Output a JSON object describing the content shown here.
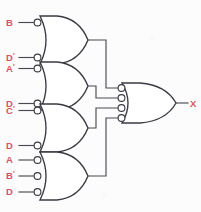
{
  "diagram": {
    "background_color": "#fcfcfc",
    "wire_color": "#4a4a52",
    "gate_outline_color": "#3a3a42",
    "label_color": "#d4545c",
    "output": {
      "label": "X",
      "name": "output-x"
    },
    "gates": [
      {
        "id": "gate-1",
        "type": "or-gate-inverted-inputs",
        "inputs": [
          {
            "label": "B",
            "prime": "",
            "inverted": true
          },
          {
            "label": "D",
            "prime": "′",
            "inverted": true
          }
        ]
      },
      {
        "id": "gate-2",
        "type": "or-gate-inverted-inputs",
        "inputs": [
          {
            "label": "A",
            "prime": "′",
            "inverted": true
          },
          {
            "label": "D",
            "prime": "",
            "inverted": true
          }
        ]
      },
      {
        "id": "gate-3",
        "type": "or-gate-inverted-inputs",
        "inputs": [
          {
            "label": "C",
            "prime": "′",
            "inverted": true
          },
          {
            "label": "D",
            "prime": "",
            "inverted": true
          }
        ]
      },
      {
        "id": "gate-4",
        "type": "or-gate-inverted-inputs",
        "inputs": [
          {
            "label": "A",
            "prime": "",
            "inverted": true
          },
          {
            "label": "B",
            "prime": "′",
            "inverted": true
          },
          {
            "label": "D",
            "prime": "",
            "inverted": true
          }
        ]
      },
      {
        "id": "gate-output",
        "type": "or-gate-inverted-inputs",
        "input_count": 4,
        "inputs": [
          {
            "label": "",
            "prime": "",
            "inverted": true
          },
          {
            "label": "",
            "prime": "",
            "inverted": true
          },
          {
            "label": "",
            "prime": "",
            "inverted": true
          },
          {
            "label": "",
            "prime": "",
            "inverted": true
          }
        ]
      }
    ]
  }
}
